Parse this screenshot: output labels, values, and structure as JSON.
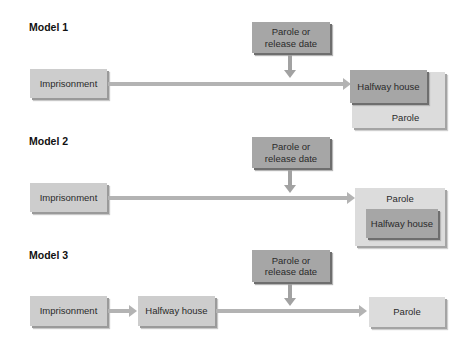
{
  "models": [
    {
      "label": "Model 1",
      "start": "Imprisonment",
      "trigger": "Parole or release date",
      "trigger_line1": "Parole or",
      "trigger_line2": "release date",
      "front": "Halfway house",
      "back": "Parole"
    },
    {
      "label": "Model 2",
      "start": "Imprisonment",
      "trigger_line1": "Parole or",
      "trigger_line2": "release date",
      "outer": "Parole",
      "inner": "Halfway house"
    },
    {
      "label": "Model 3",
      "start": "Imprisonment",
      "middle": "Halfway house",
      "trigger_line1": "Parole or",
      "trigger_line2": "release date",
      "end": "Parole"
    }
  ],
  "colors": {
    "dark_box": "#a6a6a6",
    "light_box": "#cdcdcd",
    "pale_box": "#dcdcdc",
    "connector": "#b3b3b3"
  }
}
